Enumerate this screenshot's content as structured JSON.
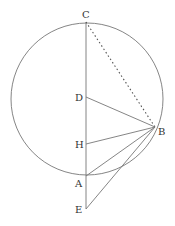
{
  "diagram": {
    "type": "geometry",
    "stroke_color": "#777777",
    "circle": {
      "cx": 87,
      "cy": 99,
      "r": 76
    },
    "points": {
      "C": {
        "x": 86,
        "y": 22,
        "label": "C"
      },
      "D": {
        "x": 86,
        "y": 97,
        "label": "D"
      },
      "B": {
        "x": 155,
        "y": 127,
        "label": "B"
      },
      "H": {
        "x": 86,
        "y": 144,
        "label": "H"
      },
      "A": {
        "x": 86,
        "y": 176,
        "label": "A"
      },
      "E": {
        "x": 86,
        "y": 209,
        "label": "E"
      }
    },
    "segments": [
      {
        "from": "C",
        "to": "E",
        "style": "solid"
      },
      {
        "from": "C",
        "to": "B",
        "style": "dotted"
      },
      {
        "from": "D",
        "to": "B",
        "style": "solid"
      },
      {
        "from": "H",
        "to": "B",
        "style": "solid"
      },
      {
        "from": "A",
        "to": "B",
        "style": "solid"
      },
      {
        "from": "E",
        "to": "B",
        "style": "solid"
      }
    ]
  }
}
